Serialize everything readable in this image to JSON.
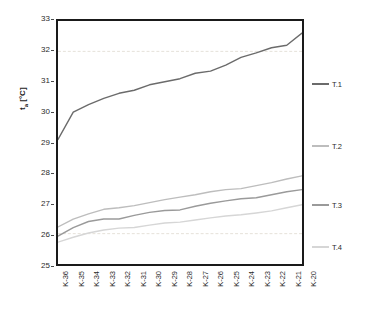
{
  "chart_data": {
    "type": "line",
    "title": "",
    "xlabel": "",
    "ylabel": "tₐ [°C]",
    "ylim": [
      25,
      33
    ],
    "yticks": [
      25,
      26,
      27,
      28,
      29,
      30,
      31,
      32,
      33
    ],
    "grid": "horizontal dashed, faint",
    "legend_position": "right",
    "categories": [
      "K-36",
      "K-35",
      "K-34",
      "K-33",
      "K-32",
      "K-31",
      "K-30",
      "K-29",
      "K-28",
      "K-27",
      "K-26",
      "K-25",
      "K-24",
      "K-23",
      "K-22",
      "K-21",
      "K-20"
    ],
    "series": [
      {
        "name": "T.1",
        "color": "#6b6b6b",
        "values": [
          29.1,
          30.0,
          30.25,
          30.45,
          30.62,
          30.72,
          30.9,
          31.0,
          31.1,
          31.28,
          31.35,
          31.55,
          31.8,
          31.95,
          32.12,
          32.2,
          32.6
        ]
      },
      {
        "name": "T.2",
        "color": "#bdbdbd",
        "values": [
          26.22,
          26.48,
          26.65,
          26.8,
          26.85,
          26.92,
          27.02,
          27.12,
          27.2,
          27.28,
          27.38,
          27.45,
          27.48,
          27.58,
          27.68,
          27.8,
          27.9
        ]
      },
      {
        "name": "T.3",
        "color": "#9a9a9a",
        "values": [
          25.92,
          26.2,
          26.4,
          26.48,
          26.48,
          26.6,
          26.7,
          26.76,
          26.78,
          26.9,
          27.0,
          27.08,
          27.15,
          27.18,
          27.28,
          27.38,
          27.45
        ]
      },
      {
        "name": "T.4",
        "color": "#d6d6d6",
        "values": [
          25.72,
          25.88,
          26.02,
          26.12,
          26.18,
          26.2,
          26.28,
          26.35,
          26.38,
          26.45,
          26.52,
          26.58,
          26.62,
          26.68,
          26.75,
          26.85,
          26.95
        ]
      }
    ]
  },
  "caption": {
    "text": ""
  },
  "colors": {
    "frame": "#1a1a1a",
    "grid": "#e4e0d8",
    "text": "#2b2b2b",
    "background": "#ffffff"
  }
}
